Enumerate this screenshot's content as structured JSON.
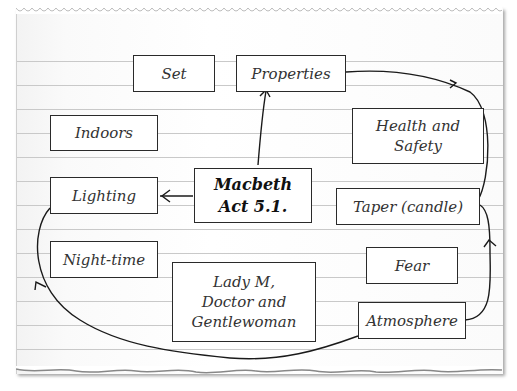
{
  "diagram": {
    "type": "mind-map",
    "center": {
      "id": "macbeth",
      "label": "Macbeth\nAct 5.1."
    },
    "nodes": [
      {
        "id": "set",
        "label": "Set"
      },
      {
        "id": "properties",
        "label": "Properties"
      },
      {
        "id": "indoors",
        "label": "Indoors"
      },
      {
        "id": "health",
        "label": "Health and\nSafety"
      },
      {
        "id": "lighting",
        "label": "Lighting"
      },
      {
        "id": "taper",
        "label": "Taper (candle)"
      },
      {
        "id": "nighttime",
        "label": "Night-time"
      },
      {
        "id": "fear",
        "label": "Fear"
      },
      {
        "id": "lady",
        "label": "Lady M,\nDoctor and\nGentlewoman"
      },
      {
        "id": "atmosphere",
        "label": "Atmosphere"
      }
    ],
    "edges": [
      {
        "from": "macbeth",
        "to": "properties",
        "arrow": true
      },
      {
        "from": "macbeth",
        "to": "lighting",
        "arrow": true
      },
      {
        "from": "properties",
        "to": "taper",
        "arrow": true
      },
      {
        "from": "taper",
        "to": "atmosphere",
        "arrow": true,
        "direction": "atmosphere-to-taper"
      },
      {
        "from": "atmosphere",
        "to": "lighting",
        "arrow": true
      }
    ],
    "colors": {
      "line": "#1a1a1a",
      "border": "#2a2a2a",
      "rule": "#c9c9c9",
      "paper": "#ffffff"
    }
  }
}
